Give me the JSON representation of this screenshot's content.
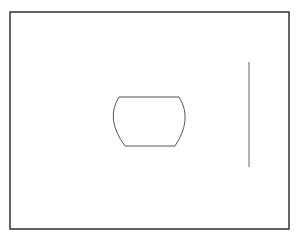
{
  "canvas": {
    "width": 297,
    "height": 236,
    "background": "#ffffff"
  },
  "frame": {
    "x": 10,
    "y": 12,
    "width": 279,
    "height": 217,
    "stroke": "#333333",
    "stroke_width": 1.5
  },
  "shape": {
    "kind": "barrel",
    "stroke": "#555555",
    "stroke_width": 1
  },
  "line": {
    "x1": 249,
    "y1": 62,
    "x2": 249,
    "y2": 167,
    "stroke": "#666666",
    "stroke_width": 1
  }
}
